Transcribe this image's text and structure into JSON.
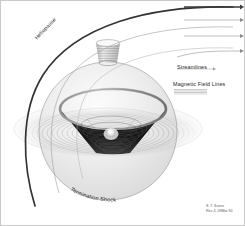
{
  "figure": {
    "background_color": "#ffffff",
    "border_color": "#c9c9c9",
    "width": 245,
    "height": 226
  },
  "labels": {
    "heliopause": "Heliopause",
    "termination_shock": "Termination Shock",
    "streamlines": "Streamlines",
    "magnetic_field_lines": "Magnetic Field Lines"
  },
  "legend": {
    "streamlines_label": "Streamlines",
    "magnetic_field_lines_label": "Magnetic Field Lines",
    "streamline_swatch_name": "arrow-line-swatch",
    "field_line_swatch_name": "hatched-band-swatch"
  },
  "credit": {
    "line1": "S. T. Suess",
    "line2": "Rev 4, 09Mar 90"
  },
  "colors": {
    "heliopause_stroke": "#333333",
    "shock_stroke": "#6d6d6d",
    "streamline_stroke": "#8a8a8a",
    "funnel_dark": "#1d1d1d",
    "funnel_mid": "#8d8d8d",
    "disk_light": "#e8e8e8",
    "sun_highlight": "#ffffff",
    "text": "#262626",
    "credit_text": "#5b5b5b"
  },
  "elements": {
    "sun_name": "sun-core",
    "funnel_name": "heliospheric-current-sheet-funnel",
    "sphere_name": "termination-shock-sphere",
    "disk_name": "equatorial-disk",
    "cylinder_name": "polar-flux-tube",
    "streamline_count": 4
  }
}
